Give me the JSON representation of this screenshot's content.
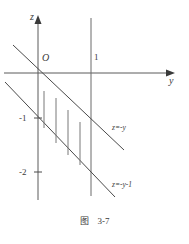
{
  "figure": {
    "caption_label": "图",
    "caption_number": "3-7",
    "axes": {
      "vertical_axis_label": "z",
      "horizontal_axis_label": "y",
      "origin_label": "O"
    },
    "ticks": {
      "horizontal": [
        {
          "label": "1",
          "value": 1
        }
      ],
      "vertical": [
        {
          "label": "-1",
          "value": -1
        },
        {
          "label": "-2",
          "value": -2
        }
      ]
    },
    "curves": [
      {
        "name": "upper-line",
        "label": "z=-y",
        "slope": -1,
        "intercept": 0
      },
      {
        "name": "lower-line",
        "label": "z=-y-1",
        "slope": -1,
        "intercept": -1
      }
    ],
    "region": {
      "name": "hatched-region",
      "hatch_count": 4,
      "hatch_orientation": "vertical"
    },
    "colors": {
      "stroke": "#4a4a4a",
      "axis": "#5a5a5a",
      "hatch": "#787878",
      "background": "#ffffff"
    }
  }
}
